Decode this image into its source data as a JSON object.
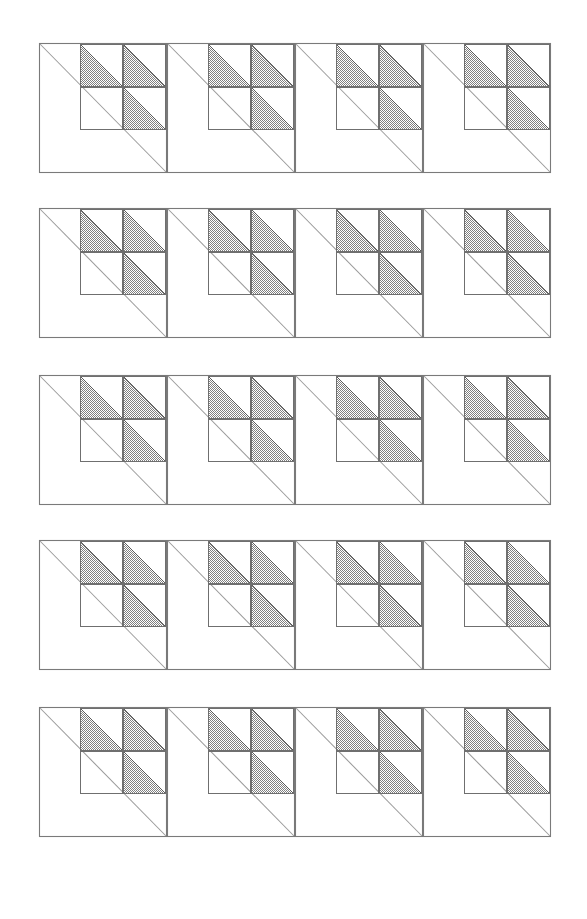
{
  "page": {
    "background_color": "#ffffff",
    "width": 587,
    "height": 919
  },
  "chart_data": {
    "type": "diagram",
    "rows": 5,
    "columns": 4,
    "total_blocks": 20,
    "grid": {
      "left": 39,
      "right": 551,
      "cell_width": 128,
      "cell_height": 130,
      "row_tops": [
        43,
        208,
        375,
        540,
        707
      ],
      "row_gap": 36
    },
    "block": {
      "outline_stroke": "#7a7a7a",
      "diagonal_stroke": "#9a9a9a",
      "quadrant_origin": "upper-right",
      "sub_grid_rows": 2,
      "sub_grid_cols": 2,
      "sub_square_size": 43,
      "shaded_sub_squares": [
        "top-left",
        "top-right",
        "bottom-right"
      ],
      "empty_sub_squares": [
        "bottom-left"
      ],
      "triangle_orientation": "lower-left half, hypotenuse top-left to bottom-right",
      "fill_style": "gray checkerboard stipple",
      "fill_color": "#808080",
      "fill_density": "50%"
    },
    "colors": {
      "background": "#ffffff",
      "outline": "#7a7a7a",
      "diagonal": "#9a9a9a",
      "triangle_fill": "#808080",
      "triangle_stroke": "#5a5a5a"
    }
  }
}
